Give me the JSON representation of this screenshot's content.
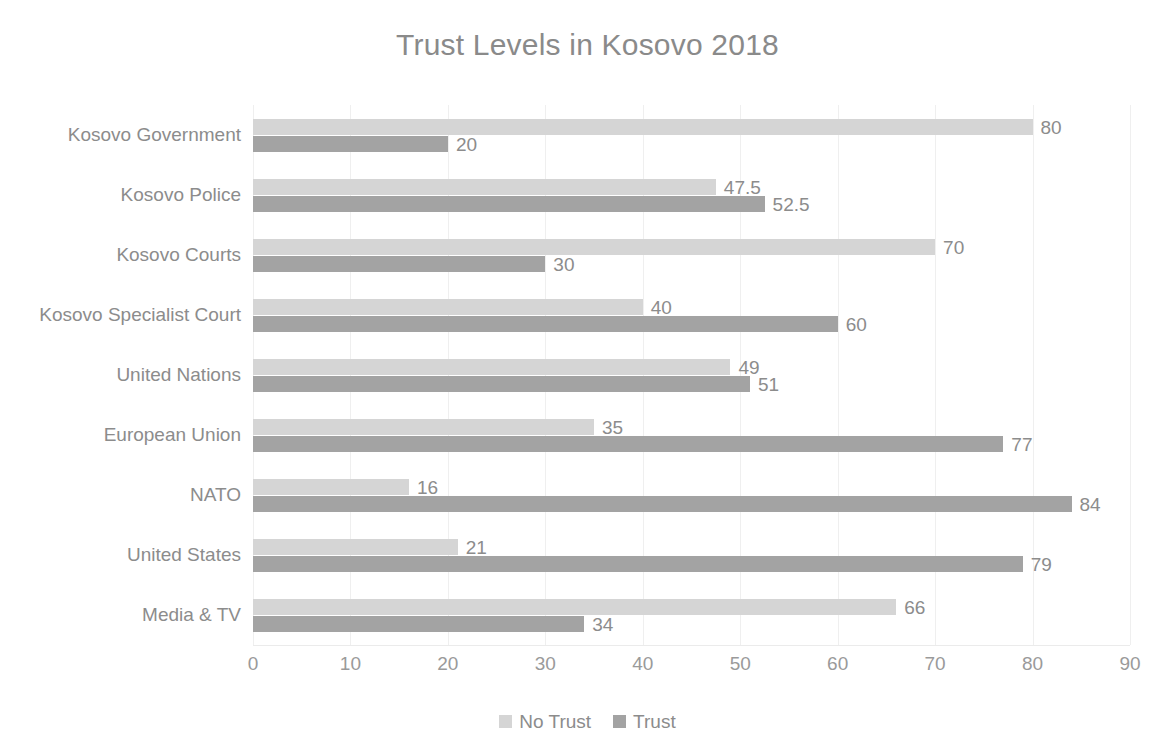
{
  "chart_data": {
    "type": "bar",
    "orientation": "horizontal",
    "title": "Trust Levels in Kosovo 2018",
    "xlabel": "",
    "ylabel": "",
    "xlim": [
      0,
      90
    ],
    "xticks": [
      0,
      10,
      20,
      30,
      40,
      50,
      60,
      70,
      80,
      90
    ],
    "tick_labels": [
      "0",
      "10",
      "20",
      "30",
      "40",
      "50",
      "60",
      "70",
      "80",
      "90"
    ],
    "grid": true,
    "legend_position": "bottom",
    "categories": [
      "Kosovo Government",
      "Kosovo Police",
      "Kosovo Courts",
      "Kosovo Specialist Court",
      "United Nations",
      "European Union",
      "NATO",
      "United States",
      "Media & TV"
    ],
    "series": [
      {
        "name": "No Trust",
        "color": "#d5d5d5",
        "values": [
          80,
          47.5,
          70,
          40,
          49,
          35,
          16,
          21,
          66
        ],
        "labels": [
          "80",
          "47.5",
          "70",
          "40",
          "49",
          "35",
          "16",
          "21",
          "66"
        ]
      },
      {
        "name": "Trust",
        "color": "#a3a3a3",
        "values": [
          20,
          52.5,
          30,
          60,
          51,
          77,
          84,
          79,
          34
        ],
        "labels": [
          "20",
          "52.5",
          "30",
          "60",
          "51",
          "77",
          "84",
          "79",
          "34"
        ]
      }
    ]
  }
}
